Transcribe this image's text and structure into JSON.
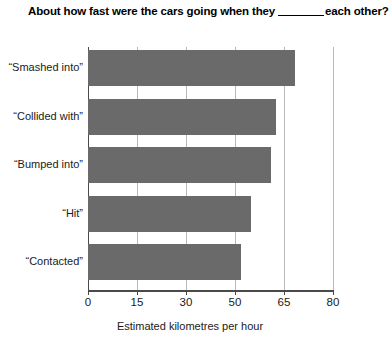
{
  "chart_data": {
    "type": "bar",
    "orientation": "horizontal",
    "title_prefix": "About how fast were the cars going when they",
    "title_suffix": "each other?",
    "title_blank": "",
    "categories": [
      "“Smashed into”",
      "“Collided with”",
      "“Bumped into”",
      "“Hit”",
      "“Contacted”"
    ],
    "values": [
      67,
      62,
      60.5,
      54.5,
      50
    ],
    "slot_positions": [
      4.23,
      3.84,
      3.74,
      3.33,
      3.12
    ],
    "xlabel": "Estimated kilometres per hour",
    "ylabel": "",
    "tick_labels": [
      "0",
      "15",
      "30",
      "50",
      "65",
      "80"
    ],
    "xlim": [
      0,
      80
    ],
    "grid": true,
    "legend": "none",
    "bar_color": "#6a6a6a",
    "gridline_color": "#b9b9b9",
    "axis_color": "#4a4a4a",
    "background_color": "#ffffff"
  }
}
